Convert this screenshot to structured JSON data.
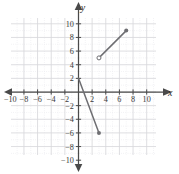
{
  "figure": {
    "title": "",
    "axis_labels": {
      "x": "x",
      "y": "y"
    },
    "colors": {
      "grid_major": "#d8d8dc",
      "grid_minor": "#e9e9ee",
      "axis": "#4a4a4a",
      "segment": "#6e6e72",
      "label_text": "#3a3a3a"
    }
  },
  "chart_data": {
    "type": "line",
    "title": "",
    "xlabel": "x",
    "ylabel": "y",
    "xlim": [
      -11.5,
      11.5
    ],
    "ylim": [
      -11.5,
      11.5
    ],
    "grid": true,
    "grid_major_step": 2,
    "grid_minor_step": 1,
    "legend": "none",
    "xticks": [
      -10,
      -8,
      -6,
      -4,
      -2,
      2,
      4,
      6,
      8,
      10
    ],
    "yticks": [
      10,
      8,
      6,
      4,
      2,
      -2,
      -4,
      -6,
      -8,
      -10
    ],
    "xtick_labels": [
      "-10",
      "-8",
      "-6",
      "-4",
      "-2",
      "2",
      "4",
      "6",
      "8",
      "10"
    ],
    "ytick_labels": [
      "10",
      "8",
      "6",
      "4",
      "2",
      "-2",
      "-4",
      "-6",
      "-8",
      "-10"
    ],
    "series": [
      {
        "name": "ascending-segment",
        "type": "segment",
        "x": [
          3,
          7
        ],
        "y": [
          5,
          9
        ],
        "start_marker": "open-circle",
        "end_marker": "filled-circle",
        "slope": 1
      },
      {
        "name": "descending-segment",
        "type": "segment",
        "x": [
          0,
          3
        ],
        "y": [
          2,
          -6
        ],
        "start_marker": "none",
        "end_marker": "filled-circle",
        "slope": -2.667
      }
    ],
    "annotations": []
  }
}
